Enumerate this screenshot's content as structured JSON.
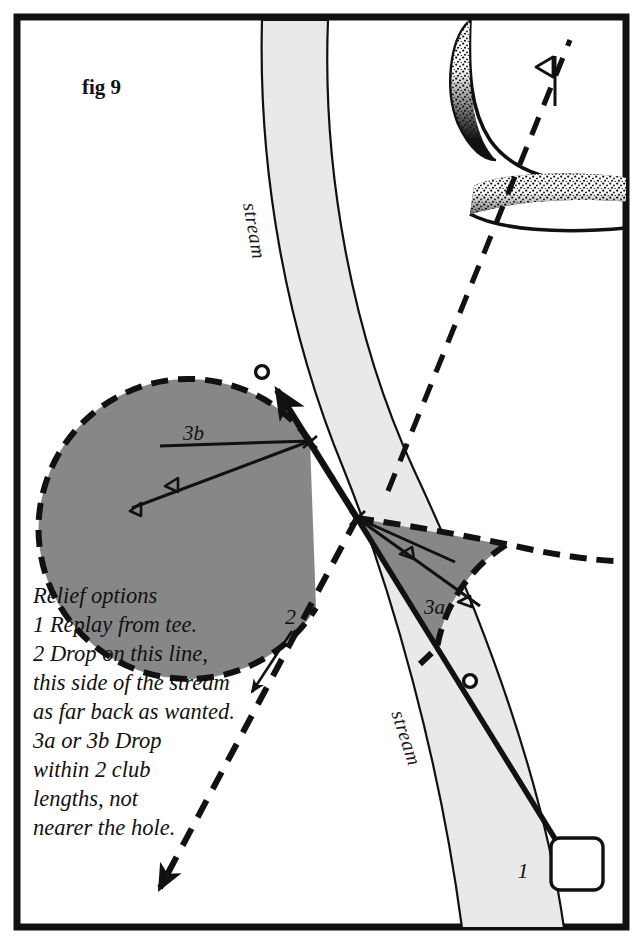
{
  "figure": {
    "label": "fig 9",
    "colors": {
      "frame": "#111111",
      "stream_fill": "#e9e9e9",
      "stream_stroke": "#111111",
      "relief_sector_fill": "#878787",
      "relief_sector_stroke": "#111111",
      "bunker_fill": "#111111",
      "line": "#111111",
      "background": "#ffffff"
    }
  },
  "map": {
    "stream": {
      "label_upper": "stream",
      "label_lower": "stream"
    },
    "green": {
      "flag_name": "flagstick",
      "bunkers": [
        {
          "name": "left-crescent-bunker"
        },
        {
          "name": "front-bunker"
        }
      ]
    },
    "tee": {
      "label": "1"
    },
    "balls": [
      {
        "name": "ball-in-stream"
      },
      {
        "name": "ball-original-line"
      }
    ],
    "relief_sectors": [
      {
        "id": "3a",
        "label": "3a",
        "club_markers": 2
      },
      {
        "id": "3b",
        "label": "3b",
        "club_markers": 2
      }
    ],
    "drop_line": {
      "label": "2"
    }
  },
  "relief_options": {
    "heading": "Relief options",
    "lines": [
      "Relief options",
      "1 Replay from tee.",
      "2 Drop on this line,",
      "this side of the stream",
      "as far back as wanted.",
      "3a or 3b Drop",
      "within 2 club",
      "lengths, not",
      "nearer the hole."
    ]
  }
}
